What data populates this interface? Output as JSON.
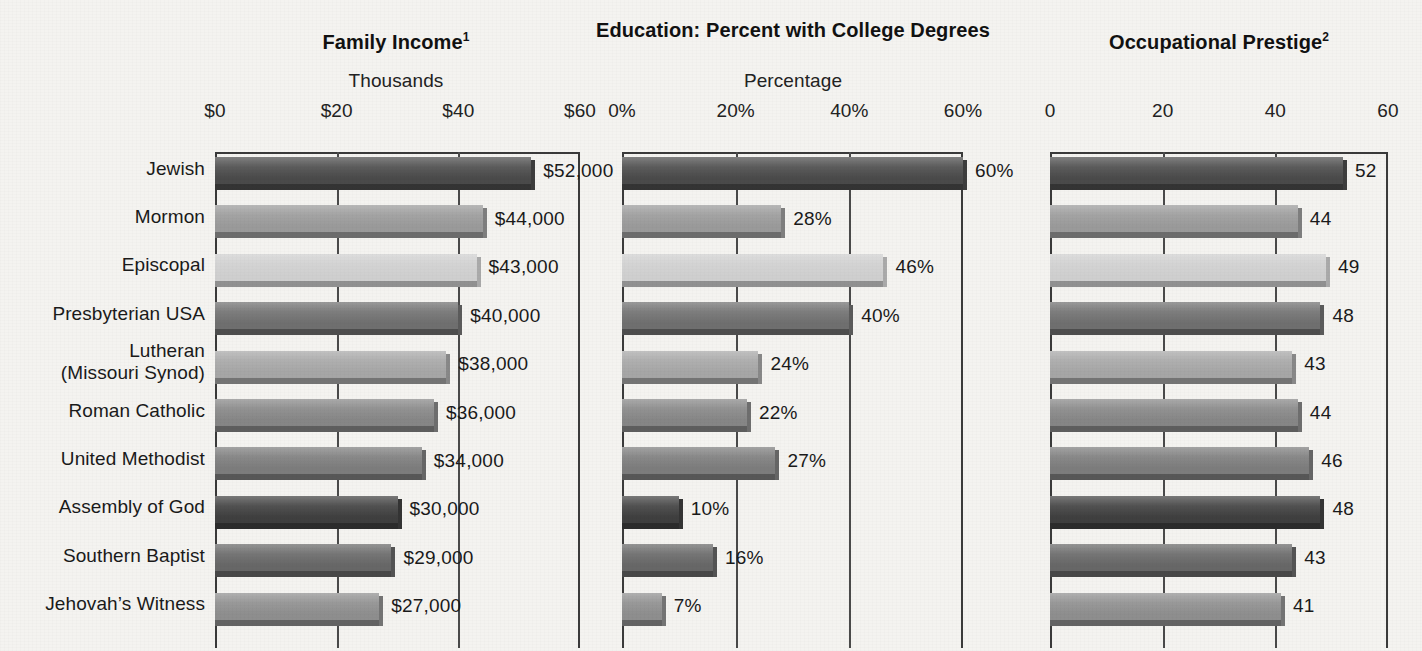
{
  "figure": {
    "background_color": "#f4f3f0",
    "text_color": "#1a1a1a"
  },
  "categories": [
    "Jewish",
    "Mormon",
    "Episcopal",
    "Presbyterian  USA",
    "Lutheran\n(Missouri Synod)",
    "Roman Catholic",
    "United Methodist",
    "Assembly of God",
    "Southern Baptist",
    "Jehovah’s Witness"
  ],
  "row_colors": [
    "#4a4a4a",
    "#9a9a9a",
    "#cfcfcf",
    "#6f6f6f",
    "#a6a6a6",
    "#868686",
    "#7c7c7c",
    "#3f3f3f",
    "#676767",
    "#8e8e8e"
  ],
  "panels": [
    {
      "id": "family-income",
      "title": "Family Income",
      "footnote": "1",
      "subtitle": "Thousands",
      "ticks": [
        "$0",
        "$20",
        "$40",
        "$60"
      ],
      "axis_max": 60,
      "labels": [
        "$52,000",
        "$44,000",
        "$43,000",
        "$40,000",
        "$38,000",
        "$36,000",
        "$34,000",
        "$30,000",
        "$29,000",
        "$27,000"
      ],
      "values": [
        52,
        44,
        43,
        40,
        38,
        36,
        34,
        30,
        29,
        27
      ]
    },
    {
      "id": "education",
      "title": "Education: Percent with College Degrees",
      "footnote": "",
      "subtitle": "Percentage",
      "ticks": [
        "0%",
        "20%",
        "40%",
        "60%"
      ],
      "axis_max": 60,
      "labels": [
        "60%",
        "28%",
        "46%",
        "40%",
        "24%",
        "22%",
        "27%",
        "10%",
        "16%",
        "7%"
      ],
      "values": [
        60,
        28,
        46,
        40,
        24,
        22,
        27,
        10,
        16,
        7
      ]
    },
    {
      "id": "occupational-prestige",
      "title": "Occupational Prestige",
      "footnote": "2",
      "subtitle": "",
      "ticks": [
        "0",
        "20",
        "40",
        "60"
      ],
      "axis_max": 60,
      "labels": [
        "52",
        "44",
        "49",
        "48",
        "43",
        "44",
        "46",
        "48",
        "43",
        "41"
      ],
      "values": [
        52,
        44,
        49,
        48,
        43,
        44,
        46,
        48,
        43,
        41
      ]
    }
  ],
  "chart_data": {
    "type": "bar",
    "orientation": "horizontal",
    "grid": true,
    "legend": "none",
    "categories": [
      "Jewish",
      "Mormon",
      "Episcopal",
      "Presbyterian USA",
      "Lutheran (Missouri Synod)",
      "Roman Catholic",
      "United Methodist",
      "Assembly of God",
      "Southern Baptist",
      "Jehovah's Witness"
    ],
    "series": [
      {
        "name": "Family Income",
        "subtitle": "Thousands",
        "footnote": "1",
        "xlabel": "Thousands",
        "xlim": [
          0,
          60
        ],
        "xticks": [
          0,
          20,
          40,
          60
        ],
        "xticklabels": [
          "$0",
          "$20",
          "$40",
          "$60"
        ],
        "values": [
          52,
          44,
          43,
          40,
          38,
          36,
          34,
          30,
          29,
          27
        ],
        "data_labels": [
          "$52,000",
          "$44,000",
          "$43,000",
          "$40,000",
          "$38,000",
          "$36,000",
          "$34,000",
          "$30,000",
          "$29,000",
          "$27,000"
        ],
        "unit": "USD thousands"
      },
      {
        "name": "Education: Percent with College Degrees",
        "subtitle": "Percentage",
        "footnote": "",
        "xlabel": "Percentage",
        "xlim": [
          0,
          60
        ],
        "xticks": [
          0,
          20,
          40,
          60
        ],
        "xticklabels": [
          "0%",
          "20%",
          "40%",
          "60%"
        ],
        "values": [
          60,
          28,
          46,
          40,
          24,
          22,
          27,
          10,
          16,
          7
        ],
        "data_labels": [
          "60%",
          "28%",
          "46%",
          "40%",
          "24%",
          "22%",
          "27%",
          "10%",
          "16%",
          "7%"
        ],
        "unit": "percent"
      },
      {
        "name": "Occupational Prestige",
        "subtitle": "",
        "footnote": "2",
        "xlabel": "",
        "xlim": [
          0,
          60
        ],
        "xticks": [
          0,
          20,
          40,
          60
        ],
        "xticklabels": [
          "0",
          "20",
          "40",
          "60"
        ],
        "values": [
          52,
          44,
          49,
          48,
          43,
          44,
          46,
          48,
          43,
          41
        ],
        "data_labels": [
          "52",
          "44",
          "49",
          "48",
          "43",
          "44",
          "46",
          "48",
          "43",
          "41"
        ],
        "unit": "prestige score"
      }
    ]
  }
}
